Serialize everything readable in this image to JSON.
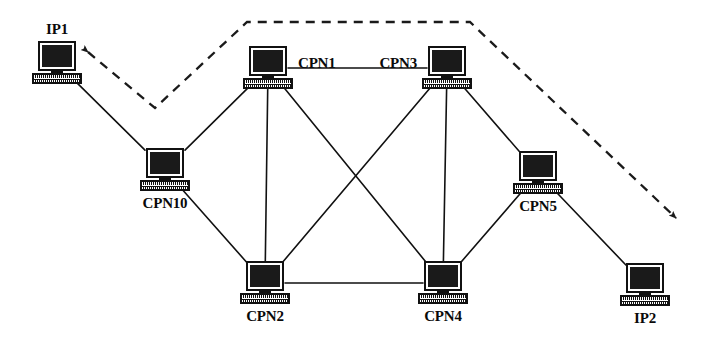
{
  "diagram": {
    "type": "network-topology",
    "canvas": {
      "width": 706,
      "height": 343
    },
    "background_color": "#ffffff",
    "line_color": "#111111",
    "dashed_color": "#1a1a1a",
    "label_color": "#0a0a0a",
    "nodes": [
      {
        "id": "ip1",
        "label": "IP1",
        "x": 57,
        "y": 63,
        "icon": "desktop-computer-icon",
        "label_position": "above"
      },
      {
        "id": "cpn1",
        "label": "CPN1",
        "x": 268,
        "y": 68,
        "icon": "desktop-computer-icon",
        "label_position": "right"
      },
      {
        "id": "cpn3",
        "label": "CPN3",
        "x": 447,
        "y": 68,
        "icon": "desktop-computer-icon",
        "label_position": "left"
      },
      {
        "id": "cpn10",
        "label": "CPN10",
        "x": 165,
        "y": 170,
        "icon": "desktop-computer-icon",
        "label_position": "below"
      },
      {
        "id": "cpn5",
        "label": "CPN5",
        "x": 538,
        "y": 173,
        "icon": "desktop-computer-icon",
        "label_position": "below"
      },
      {
        "id": "cpn2",
        "label": "CPN2",
        "x": 265,
        "y": 283,
        "icon": "desktop-computer-icon",
        "label_position": "below"
      },
      {
        "id": "cpn4",
        "label": "CPN4",
        "x": 443,
        "y": 283,
        "icon": "desktop-computer-icon",
        "label_position": "below"
      },
      {
        "id": "ip2",
        "label": "IP2",
        "x": 645,
        "y": 285,
        "icon": "desktop-computer-icon",
        "label_position": "below"
      }
    ],
    "links": [
      {
        "from": "ip1",
        "to": "cpn10",
        "style": "solid"
      },
      {
        "from": "cpn10",
        "to": "cpn1",
        "style": "solid"
      },
      {
        "from": "cpn10",
        "to": "cpn2",
        "style": "solid"
      },
      {
        "from": "cpn1",
        "to": "cpn3",
        "style": "solid"
      },
      {
        "from": "cpn1",
        "to": "cpn2",
        "style": "solid"
      },
      {
        "from": "cpn1",
        "to": "cpn4",
        "style": "solid"
      },
      {
        "from": "cpn3",
        "to": "cpn2",
        "style": "solid"
      },
      {
        "from": "cpn3",
        "to": "cpn4",
        "style": "solid"
      },
      {
        "from": "cpn3",
        "to": "cpn5",
        "style": "solid"
      },
      {
        "from": "cpn2",
        "to": "cpn4",
        "style": "solid"
      },
      {
        "from": "cpn5",
        "to": "cpn4",
        "style": "solid"
      },
      {
        "from": "cpn5",
        "to": "ip2",
        "style": "solid"
      }
    ],
    "flow_path": {
      "name": "end-to-end-dashed-path",
      "style": "dashed",
      "arrow_start": true,
      "arrow_end": true,
      "points": [
        {
          "x": 88,
          "y": 52
        },
        {
          "x": 155,
          "y": 108
        },
        {
          "x": 247,
          "y": 22
        },
        {
          "x": 470,
          "y": 22
        },
        {
          "x": 676,
          "y": 218
        }
      ]
    }
  }
}
